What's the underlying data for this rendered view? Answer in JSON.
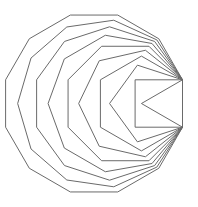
{
  "diagram": {
    "shared_edge": {
      "x": 182.5,
      "y_top": 79.8,
      "y_bottom": 127.2
    },
    "side_counts": [
      3,
      4,
      5,
      6,
      7,
      8,
      9,
      10,
      11,
      12
    ],
    "stroke_color": "#6a6a6a",
    "background": "#ffffff"
  }
}
